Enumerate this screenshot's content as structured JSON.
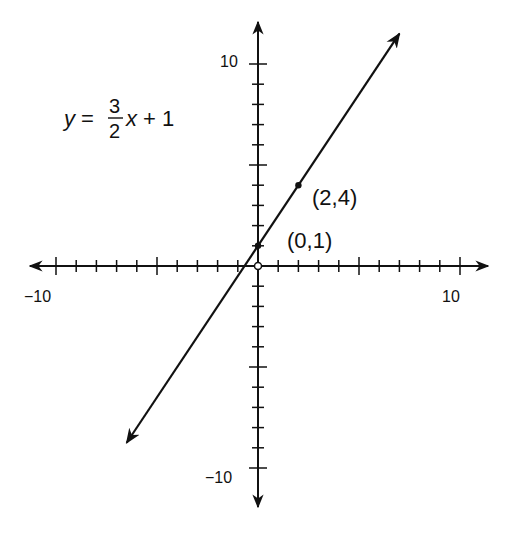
{
  "chart_data": {
    "type": "line",
    "title": "",
    "equation": {
      "lhs": "y =",
      "num": "3",
      "den": "2",
      "rhs": "x + 1"
    },
    "xlabel": "",
    "ylabel": "",
    "xlim": [
      -10,
      10
    ],
    "ylim": [
      -10,
      10
    ],
    "x_tick_labels": [
      "-10",
      "10"
    ],
    "y_tick_labels": [
      "10",
      "-10"
    ],
    "tick_step": 1,
    "major_tick_step": 5,
    "grid": false,
    "series": [
      {
        "name": "y = 3/2 x + 1",
        "slope": 1.5,
        "intercept": 1,
        "x": [
          -6.5,
          7
        ],
        "y": [
          -8.75,
          11.5
        ]
      }
    ],
    "points": [
      {
        "label": "(2,4)",
        "x": 2,
        "y": 4,
        "style": "filled"
      },
      {
        "label": "(0,1)",
        "x": 0,
        "y": 1,
        "style": "filled"
      },
      {
        "label": "",
        "x": 0,
        "y": 0,
        "style": "open"
      }
    ]
  },
  "labels": {
    "x_min": "−10",
    "x_max": "10",
    "y_max": "10",
    "y_min": "−10",
    "point_a": "(2,4)",
    "point_b": "(0,1)",
    "eq_lhs": "y =",
    "eq_num": "3",
    "eq_den": "2",
    "eq_rhs": "x + 1"
  }
}
